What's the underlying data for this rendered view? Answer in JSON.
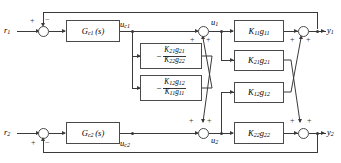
{
  "diagram": {
    "type": "control-block-diagram",
    "line_color": "#3a3a3a",
    "box_border_color": "#4a4a4a",
    "background": "#ffffff"
  },
  "signals": {
    "r1": "r",
    "r1_sub": "1",
    "r2": "r",
    "r2_sub": "2",
    "uc1": "u",
    "uc1_sub": "c1",
    "uc2": "u",
    "uc2_sub": "c2",
    "u1": "u",
    "u1_sub": "1",
    "u2": "u",
    "u2_sub": "2",
    "y1": "y",
    "y1_sub": "1",
    "y2": "y",
    "y2_sub": "2"
  },
  "controllers": [
    {
      "name": "Gc1",
      "base": "G",
      "sub": "c1",
      "arg": "(s)"
    },
    {
      "name": "Gc2",
      "base": "G",
      "sub": "c2",
      "arg": "(s)"
    }
  ],
  "process_blocks": [
    {
      "name": "K11g11",
      "k": "K",
      "k_sub": "11",
      "g": "g",
      "g_sub": "11"
    },
    {
      "name": "K21g21",
      "k": "K",
      "k_sub": "21",
      "g": "g",
      "g_sub": "21"
    },
    {
      "name": "K12g12",
      "k": "K",
      "k_sub": "12",
      "g": "g",
      "g_sub": "12"
    },
    {
      "name": "K22g22",
      "k": "K",
      "k_sub": "22",
      "g": "g",
      "g_sub": "22"
    }
  ],
  "decouplers": [
    {
      "name": "decoupler-d21",
      "sign": "−",
      "numerator": {
        "k": "K",
        "k_sub": "21",
        "g": "g",
        "g_sub": "21"
      },
      "denominator": {
        "k": "K",
        "k_sub": "22",
        "g": "g",
        "g_sub": "22"
      }
    },
    {
      "name": "decoupler-d12",
      "sign": "−",
      "numerator": {
        "k": "K",
        "k_sub": "12",
        "g": "g",
        "g_sub": "12"
      },
      "denominator": {
        "k": "K",
        "k_sub": "11",
        "g": "g",
        "g_sub": "11"
      }
    }
  ],
  "summing_junctions": [
    {
      "name": "error-junction-1",
      "signs": [
        "+",
        "−"
      ]
    },
    {
      "name": "error-junction-2",
      "signs": [
        "+",
        "−"
      ]
    },
    {
      "name": "input-junction-u1",
      "signs": [
        "+",
        "+"
      ]
    },
    {
      "name": "input-junction-u2",
      "signs": [
        "+",
        "+"
      ]
    },
    {
      "name": "output-junction-y1",
      "signs": [
        "+",
        "+"
      ]
    },
    {
      "name": "output-junction-y2",
      "signs": [
        "+",
        "+"
      ]
    }
  ],
  "signs": {
    "plus": "+",
    "minus": "−"
  }
}
